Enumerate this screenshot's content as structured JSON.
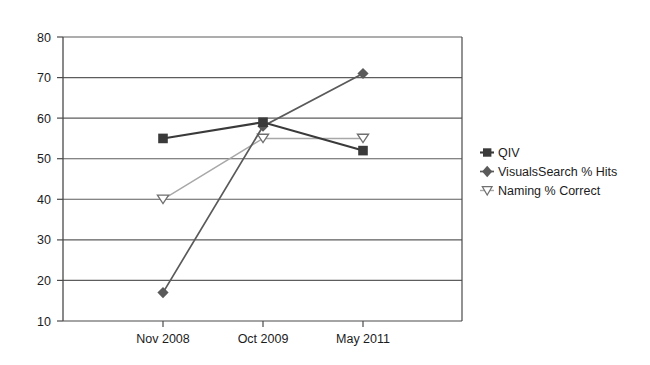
{
  "chart_data": {
    "type": "line",
    "title": "",
    "subtitle": "",
    "xlabel": "",
    "ylabel": "",
    "categories": [
      "Nov 2008",
      "Oct 2009",
      "May 2011"
    ],
    "series": [
      {
        "name": "QIV",
        "marker": "filled-square",
        "color": "#3a3a3a",
        "values": [
          55,
          59,
          52
        ]
      },
      {
        "name": "VisualsSearch % Hits",
        "marker": "filled-diamond",
        "color": "#5a5a5a",
        "values": [
          17,
          58,
          71
        ]
      },
      {
        "name": "Naming % Correct",
        "marker": "open-triangle-down",
        "color": "#a8a8a8",
        "values": [
          40,
          55,
          55
        ]
      }
    ],
    "ylim": [
      10,
      80
    ],
    "ytick_labels": [
      "10",
      "20",
      "30",
      "40",
      "50",
      "60",
      "70",
      "80"
    ],
    "ytick_values": [
      10,
      20,
      30,
      40,
      50,
      60,
      70,
      80
    ],
    "grid": true,
    "grid_axis": "y",
    "legend_position": "right",
    "legend_entries": [
      "QIV",
      "VisualsSearch % Hits",
      "Naming % Correct"
    ],
    "plot_background": "#ffffff",
    "axis_color": "#4a4a4a",
    "grid_color": "#6b6b6b"
  }
}
